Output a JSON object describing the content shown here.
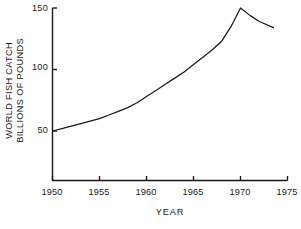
{
  "chart_data": {
    "type": "line",
    "title": "",
    "xlabel": "YEAR",
    "ylabel": "WORLD FISH CATCH BILLIONS OF POUNDS",
    "ylabel_lines": [
      "WORLD FISH CATCH",
      "BILLIONS OF POUNDS"
    ],
    "xlim": [
      1950,
      1975
    ],
    "ylim": [
      0,
      150
    ],
    "grid": false,
    "legend": null,
    "xticks": [
      1950,
      1955,
      1960,
      1965,
      1970,
      1975
    ],
    "xtick_labels": [
      "1950",
      "1955",
      "1960",
      "1965",
      "1970",
      "1975"
    ],
    "yticks": [
      50,
      100,
      150
    ],
    "ytick_labels": [
      "50",
      "100",
      "150"
    ],
    "line_color": "#1a1a1a",
    "series": [
      {
        "name": "World fish catch",
        "x": [
          1950,
          1951,
          1952,
          1953,
          1954,
          1955,
          1956,
          1957,
          1958,
          1959,
          1960,
          1961,
          1962,
          1963,
          1964,
          1965,
          1966,
          1967,
          1968,
          1969,
          1970,
          1971,
          1972,
          1973.5
        ],
        "values": [
          50,
          52,
          54,
          56,
          58,
          60,
          63,
          66,
          69,
          73,
          78,
          83,
          88,
          93,
          98,
          104,
          110,
          116,
          123,
          135,
          150,
          144,
          139,
          134
        ]
      }
    ]
  },
  "axes": {
    "x_axis_name": "x-axis",
    "y_axis_name": "y-axis"
  }
}
